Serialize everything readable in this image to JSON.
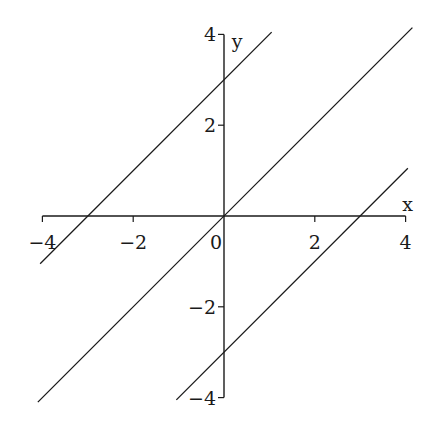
{
  "chart_data": {
    "type": "line",
    "title": "",
    "xlabel": "x",
    "ylabel": "y",
    "xlim": [
      -4,
      4
    ],
    "ylim": [
      -4,
      4
    ],
    "x_ticks": [
      -4,
      -2,
      0,
      2,
      4
    ],
    "y_ticks": [
      -4,
      -2,
      2,
      4
    ],
    "x_tick_labels": [
      "−4",
      "−2",
      "0",
      "2",
      "4"
    ],
    "y_tick_labels": [
      "−4",
      "−2",
      "2",
      "4"
    ],
    "grid": false,
    "legend": null,
    "series": [
      {
        "name": "y = x + 3",
        "x": [
          -4.05,
          1.05
        ],
        "y": [
          -1.05,
          4.05
        ]
      },
      {
        "name": "y = x",
        "x": [
          -4.1,
          4.15
        ],
        "y": [
          -4.1,
          4.15
        ]
      },
      {
        "name": "y = x - 3",
        "x": [
          -1.05,
          4.05
        ],
        "y": [
          -4.05,
          1.05
        ]
      }
    ],
    "line_color": "#1a1a1a"
  },
  "labels": {
    "x_axis": "x",
    "y_axis": "y",
    "origin": "0"
  }
}
